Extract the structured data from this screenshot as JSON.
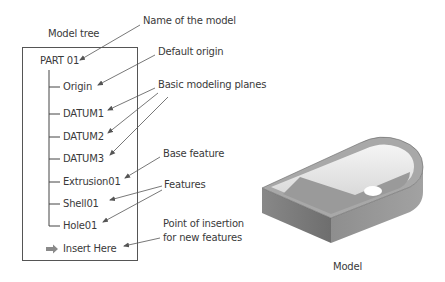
{
  "tree": {
    "title": "Model tree",
    "root": "PART 01",
    "items": [
      "Origin",
      "DATUM1",
      "DATUM2",
      "DATUM3",
      "Extrusion01",
      "Shell01",
      "Hole01"
    ],
    "insert": "Insert Here"
  },
  "callouts": {
    "name": "Name of the model",
    "origin": "Default origin",
    "planes": "Basic modeling planes",
    "base": "Base feature",
    "features": "Features",
    "insert_line1": "Point of insertion",
    "insert_line2": "for new features"
  },
  "model": {
    "caption": "Model"
  },
  "colors": {
    "line": "#555555",
    "arrow_icon": "#8a8a8a",
    "model_dark": "#7a7a7a",
    "model_light": "#e8e8e8"
  }
}
